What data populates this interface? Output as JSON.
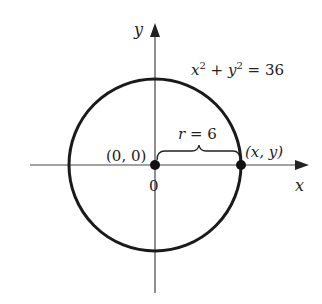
{
  "diagram": {
    "equation": {
      "lhs_x": "x",
      "sup1": "2",
      "plus": " + ",
      "lhs_y": "y",
      "sup2": "2",
      "rhs": " = 36"
    },
    "axes": {
      "x_label": "x",
      "y_label": "y",
      "origin_tick_label": "0"
    },
    "points": {
      "origin_label": "(0, 0)",
      "point_label": "(x, y)"
    },
    "radius_label": {
      "r": "r",
      "eq": " = 6"
    },
    "colors": {
      "stroke": "#1a1a1a",
      "axis": "#444444",
      "background": "#ffffff"
    }
  }
}
